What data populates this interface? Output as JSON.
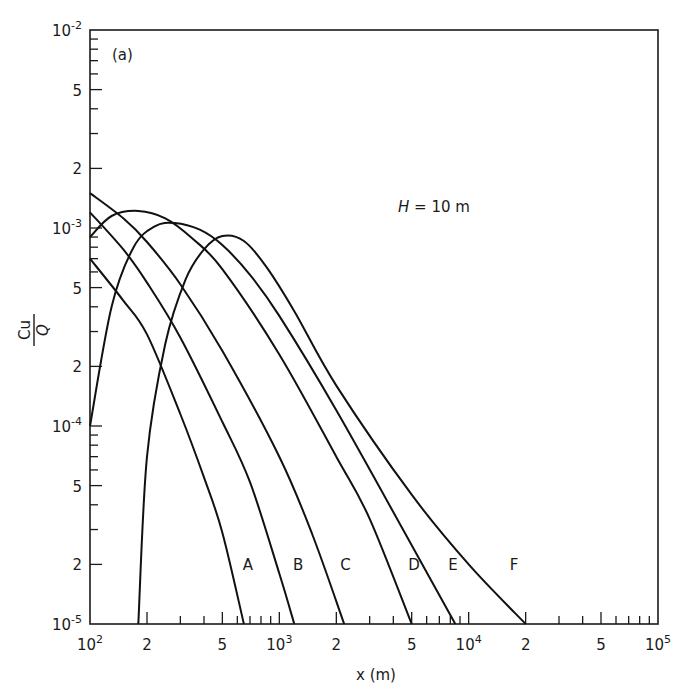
{
  "chart_data": {
    "type": "line",
    "panel_label": "(a)",
    "annotation": "H = 10 m",
    "annotation_parts": {
      "var": "H",
      "rest": " = 10 m"
    },
    "xlabel": "x (m)",
    "ylabel": "Cu/Q",
    "ylabel_parts": {
      "num": "Cu",
      "den": "Q"
    },
    "xscale": "log",
    "yscale": "log",
    "xlim": [
      100,
      100000
    ],
    "ylim": [
      1e-05,
      0.01
    ],
    "grid": false,
    "legend": "inline curve labels",
    "x_tick_labels": [
      {
        "value": 100,
        "base": "10",
        "exp": "2"
      },
      {
        "value": 200,
        "text": "2"
      },
      {
        "value": 500,
        "text": "5"
      },
      {
        "value": 1000,
        "base": "10",
        "exp": "3"
      },
      {
        "value": 2000,
        "text": "2"
      },
      {
        "value": 5000,
        "text": "5"
      },
      {
        "value": 10000,
        "base": "10",
        "exp": "4"
      },
      {
        "value": 20000,
        "text": "2"
      },
      {
        "value": 50000,
        "text": "5"
      },
      {
        "value": 100000,
        "base": "10",
        "exp": "5"
      }
    ],
    "y_tick_labels": [
      {
        "value": 0.01,
        "base": "10",
        "exp": "-2"
      },
      {
        "value": 0.005,
        "text": "5"
      },
      {
        "value": 0.002,
        "text": "2"
      },
      {
        "value": 0.001,
        "base": "10",
        "exp": "-3"
      },
      {
        "value": 0.0005,
        "text": "5"
      },
      {
        "value": 0.0002,
        "text": "2"
      },
      {
        "value": 0.0001,
        "base": "10",
        "exp": "-4"
      },
      {
        "value": 5e-05,
        "text": "5"
      },
      {
        "value": 2e-05,
        "text": "2"
      },
      {
        "value": 1e-05,
        "base": "10",
        "exp": "-5"
      }
    ],
    "series": [
      {
        "name": "A",
        "label_at": [
          640,
          2e-05
        ],
        "x": [
          100,
          150,
          200,
          300,
          400,
          500,
          650
        ],
        "y": [
          0.0007,
          0.00043,
          0.00029,
          0.000115,
          5.5e-05,
          2.9e-05,
          1e-05
        ]
      },
      {
        "name": "B",
        "label_at": [
          1180,
          2e-05
        ],
        "x": [
          100,
          150,
          200,
          300,
          500,
          700,
          1000,
          1200
        ],
        "y": [
          0.0012,
          0.00078,
          0.00053,
          0.00028,
          0.000105,
          5.2e-05,
          1.8e-05,
          1e-05
        ]
      },
      {
        "name": "C",
        "label_at": [
          2100,
          2e-05
        ],
        "x": [
          100,
          150,
          200,
          300,
          500,
          1000,
          1500,
          2200
        ],
        "y": [
          0.0015,
          0.00112,
          0.00085,
          0.00052,
          0.00024,
          7e-05,
          2.8e-05,
          1e-05
        ]
      },
      {
        "name": "D",
        "label_at": [
          4800,
          2e-05
        ],
        "x": [
          100,
          130,
          180,
          250,
          350,
          500,
          1000,
          2000,
          3000,
          5000
        ],
        "y": [
          0.0009,
          0.00115,
          0.00122,
          0.00112,
          0.00088,
          0.00062,
          0.00023,
          7e-05,
          3.4e-05,
          1e-05
        ]
      },
      {
        "name": "E",
        "label_at": [
          7800,
          2e-05
        ],
        "x": [
          100,
          130,
          170,
          220,
          280,
          380,
          500,
          700,
          1000,
          2000,
          5000,
          8500
        ],
        "y": [
          0.0001,
          0.0004,
          0.0008,
          0.00102,
          0.00106,
          0.00098,
          0.00082,
          0.00058,
          0.00036,
          0.00012,
          2.5e-05,
          1e-05
        ]
      },
      {
        "name": "F",
        "label_at": [
          16500,
          2e-05
        ],
        "x": [
          180,
          200,
          250,
          320,
          400,
          500,
          650,
          850,
          1200,
          2000,
          5000,
          10000,
          20000
        ],
        "y": [
          1e-05,
          7e-05,
          0.00026,
          0.00055,
          0.00078,
          0.00091,
          0.00086,
          0.00064,
          0.00038,
          0.00016,
          4.5e-05,
          2e-05,
          1e-05
        ]
      }
    ]
  }
}
